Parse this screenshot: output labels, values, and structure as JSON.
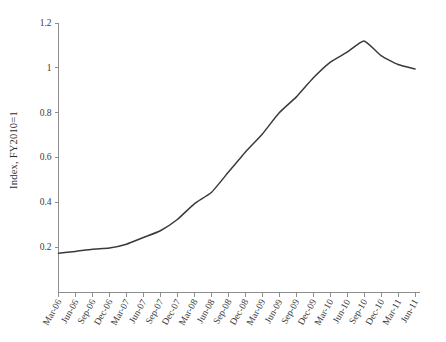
{
  "chart_data": {
    "type": "line",
    "title": "",
    "subtitle": "",
    "xlabel": "",
    "ylabel": "Index, FY2010=1",
    "ylim": [
      0,
      1.2
    ],
    "yticks": [
      0.2,
      0.4,
      0.6,
      0.8,
      1,
      1.2
    ],
    "ytick_labels": [
      "0.2",
      "0.4",
      "0.6",
      "0.8",
      "1",
      "1.2"
    ],
    "grid": false,
    "legend": null,
    "legend_position": "none",
    "line_color": "#3a3a3a",
    "axis_color": "#8d8d8d",
    "categories": [
      "Mar-06",
      "Jun-06",
      "Sep-06",
      "Dec-06",
      "Mar-07",
      "Jun-07",
      "Sep-07",
      "Dec-07",
      "Mar-08",
      "Jun-08",
      "Sep-08",
      "Dec-08",
      "Mar-09",
      "Jun-09",
      "Sep-09",
      "Dec-09",
      "Mar-10",
      "Jun-10",
      "Sep-10",
      "Dec-10",
      "Mar-11",
      "Jun-11"
    ],
    "values": [
      0.175,
      0.183,
      0.193,
      0.198,
      0.215,
      0.245,
      0.275,
      0.325,
      0.395,
      0.445,
      0.535,
      0.625,
      0.705,
      0.8,
      0.87,
      0.955,
      1.025,
      1.07,
      1.12,
      1.055,
      1.015,
      0.995
    ],
    "series": [
      {
        "name": "Index, FY2010=1",
        "values": [
          0.175,
          0.183,
          0.193,
          0.198,
          0.215,
          0.245,
          0.275,
          0.325,
          0.395,
          0.445,
          0.535,
          0.625,
          0.705,
          0.8,
          0.87,
          0.955,
          1.025,
          1.07,
          1.12,
          1.055,
          1.015,
          0.995
        ]
      }
    ]
  }
}
